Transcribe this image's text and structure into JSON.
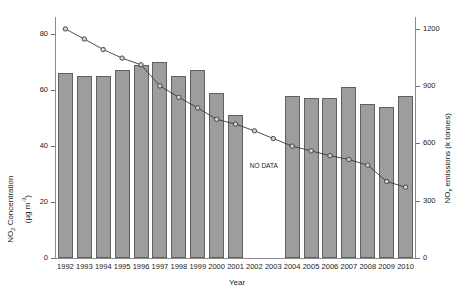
{
  "chart_data": {
    "type": "bar",
    "title": "",
    "xlabel": "Year",
    "categories": [
      "1992",
      "1993",
      "1994",
      "1995",
      "1996",
      "1997",
      "1998",
      "1999",
      "2000",
      "2001",
      "2002",
      "2003",
      "2004",
      "2005",
      "2006",
      "2007",
      "2008",
      "2009",
      "2010"
    ],
    "grid": false,
    "legend": "none",
    "annotations": [
      {
        "text": "NO DATA",
        "x_range": [
          "2002",
          "2003"
        ],
        "note": "no bar data for 2002 and 2003"
      }
    ],
    "axes": {
      "left": {
        "label_line1": "NO2 Concentration",
        "label_line2": "(µg m-3)",
        "ticks": [
          0,
          20,
          40,
          60,
          80
        ],
        "ylim": [
          0,
          86
        ]
      },
      "right": {
        "label": "NOx emissions (k tonnes)",
        "ticks": [
          0,
          300,
          600,
          900,
          1200
        ],
        "ylim": [
          0,
          1260
        ]
      }
    },
    "series": [
      {
        "name": "NO2 Concentration",
        "type": "bar",
        "axis": "left",
        "unit": "µg m-3",
        "color": "#9d9d9d",
        "categories": [
          "1992",
          "1993",
          "1994",
          "1995",
          "1996",
          "1997",
          "1998",
          "1999",
          "2000",
          "2001",
          "2002",
          "2003",
          "2004",
          "2005",
          "2006",
          "2007",
          "2008",
          "2009",
          "2010"
        ],
        "values": [
          66,
          65,
          65,
          67,
          69,
          70,
          65,
          67,
          59,
          51,
          null,
          null,
          58,
          57,
          57,
          61,
          55,
          54,
          58
        ]
      },
      {
        "name": "NOx emissions",
        "type": "line",
        "axis": "right",
        "unit": "k tonnes",
        "color": "#3a3a3a",
        "marker": "open-circle",
        "categories": [
          "1992",
          "1993",
          "1994",
          "1995",
          "1996",
          "1997",
          "1998",
          "1999",
          "2000",
          "2001",
          "2002",
          "2003",
          "2004",
          "2005",
          "2006",
          "2007",
          "2008",
          "2009",
          "2010"
        ],
        "values": [
          1198,
          1145,
          1090,
          1045,
          1010,
          900,
          840,
          785,
          725,
          700,
          665,
          625,
          585,
          560,
          535,
          515,
          485,
          400,
          370
        ]
      }
    ]
  },
  "labels": {
    "year_axis": "Year",
    "no_data": "NO DATA",
    "left_axis_line1": "NO",
    "left_axis_line1_sub": "2",
    "left_axis_line1_rest": " Concentration",
    "left_axis_line2_pre": "(µg m",
    "left_axis_line2_sup": "-3",
    "left_axis_line2_post": ")",
    "right_axis_pre": "NO",
    "right_axis_sub": "x",
    "right_axis_post": " emissions (k tonnes)"
  },
  "colors": {
    "bar_fill": "#9d9d9d",
    "bar_stroke": "#5f5f5f",
    "line": "#3a3a3a",
    "marker_fill": "#d2d2d2",
    "axis": "#8c8c8c",
    "background": "#ffffff"
  }
}
